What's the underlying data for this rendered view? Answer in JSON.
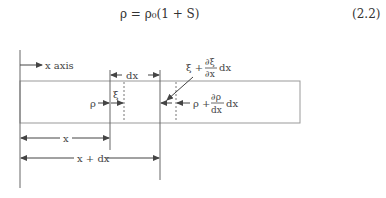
{
  "equation": {
    "text": "ρ = ρ₀(1 + S)",
    "number": "(2.2)"
  },
  "diagram": {
    "x_axis_label": "x axis",
    "dx_label": "dx",
    "xi_label": "ξ",
    "rho_label": "ρ",
    "xi_plus_label_prefix": "ξ +",
    "xi_plus_num": "∂ξ",
    "xi_plus_den": "∂x",
    "xi_plus_suffix": "dx",
    "rho_plus_label_prefix": "ρ +",
    "rho_plus_num": "∂ρ",
    "rho_plus_den": "dx",
    "rho_plus_suffix": "dx",
    "x_label": "x",
    "x_plus_dx_label": "x + dx"
  },
  "colors": {
    "line": "#555555",
    "box": "#999999"
  }
}
